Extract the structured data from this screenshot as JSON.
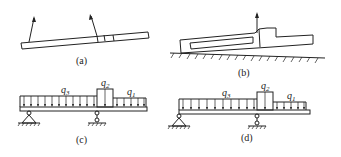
{
  "figure": {
    "panels": [
      {
        "id": "a",
        "caption": "(a)",
        "description": "slanted bar with two upward force arrows and small joint segments"
      },
      {
        "id": "b",
        "caption": "(b)",
        "description": "component resting on hatched ground with slot and one upward arrow"
      },
      {
        "id": "c",
        "caption": "(c)",
        "description": "beam with distributed loads q3, q2, q1 on pinned and roller supports"
      },
      {
        "id": "d",
        "caption": "(d)",
        "description": "beam with distributed loads q3, q2, q1 on pinned and roller supports"
      }
    ],
    "loads": {
      "c": [
        {
          "symbol": "q",
          "sub": "3"
        },
        {
          "symbol": "q",
          "sub": "2"
        },
        {
          "symbol": "q",
          "sub": "1"
        }
      ],
      "d": [
        {
          "symbol": "q",
          "sub": "3"
        },
        {
          "symbol": "q",
          "sub": "2"
        },
        {
          "symbol": "q",
          "sub": "1"
        }
      ]
    }
  }
}
